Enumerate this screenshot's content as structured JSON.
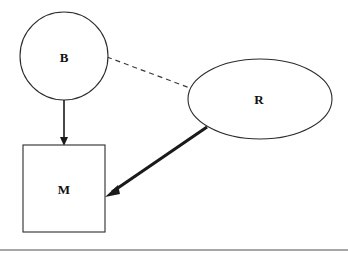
{
  "figure": {
    "background_color": "#ffffff",
    "stroke_color": "#2b2b2b",
    "label_color": "#111111",
    "width": 348,
    "height": 255
  },
  "nodes": [
    {
      "id": "B",
      "label": "B",
      "shape": "circle",
      "cx": 64,
      "cy": 56,
      "r": 44,
      "label_x": 64,
      "label_y": 57
    },
    {
      "id": "M",
      "label": "M",
      "shape": "rectangle",
      "x": 23,
      "y": 145,
      "width": 82,
      "height": 87,
      "label_x": 64,
      "label_y": 189
    },
    {
      "id": "R",
      "label": "R",
      "shape": "ellipse",
      "cx": 260,
      "cy": 99,
      "rx": 72,
      "ry": 40,
      "label_x": 259,
      "label_y": 99
    }
  ],
  "edges": [
    {
      "id": "b-to-m",
      "from": "B",
      "to": "M",
      "style": "solid",
      "arrow": "single",
      "path": "M 64 100 L 64 142",
      "arrow_head": "64,146 60,137 68,137"
    },
    {
      "id": "b-to-r",
      "from": "B",
      "to": "R",
      "style": "dashed",
      "arrow": "none",
      "path": "M 107 57 L 190 88",
      "arrow_head": ""
    },
    {
      "id": "r-to-m",
      "from": "R",
      "to": "M",
      "style": "thick-solid",
      "arrow": "single",
      "path": "M 207 127 L 112 192",
      "arrow_head": "105,197 118,185 120,194"
    }
  ],
  "footer_rule": {
    "x1": 0,
    "y1": 250,
    "x2": 348,
    "y2": 250,
    "color": "#8a8a8a"
  }
}
